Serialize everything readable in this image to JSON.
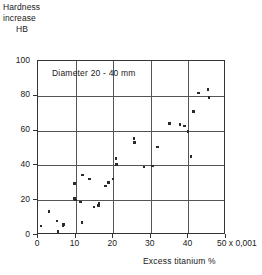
{
  "figure": {
    "y_axis_caption_lines": [
      "Hardness",
      "increase",
      "HB"
    ],
    "x_axis_title": "Excess titanium  %",
    "x_multiplier_label": "x 0,001",
    "annotation": "Diameter  20 - 40 mm"
  },
  "chart_data": {
    "type": "scatter",
    "title": "",
    "subtitle": "",
    "annotations": [
      "Diameter  20 - 40 mm"
    ],
    "xlabel": "Excess titanium  %",
    "ylabel": "Hardness increase HB",
    "x_unit_note": "x 0,001",
    "xlim": [
      0,
      50
    ],
    "ylim": [
      0,
      100
    ],
    "xticks": [
      0,
      10,
      20,
      30,
      40,
      50
    ],
    "yticks": [
      0,
      20,
      40,
      60,
      80,
      100
    ],
    "xtick_labels": [
      "0",
      "10",
      "20",
      "30",
      "40",
      "50"
    ],
    "ytick_labels": [
      "0",
      "20",
      "40",
      "60",
      "80",
      "100"
    ],
    "grid": true,
    "legend": null,
    "marker": "square",
    "marker_color": "#2a2a2a",
    "series": [
      {
        "name": "Diameter 20 - 40 mm",
        "points": [
          {
            "x": 1.1,
            "y": 4.5
          },
          {
            "x": 3.2,
            "y": 13.0
          },
          {
            "x": 5.3,
            "y": 7.5
          },
          {
            "x": 5.6,
            "y": 1.5
          },
          {
            "x": 6.9,
            "y": 4.5
          },
          {
            "x": 7.1,
            "y": 5.5
          },
          {
            "x": 9.9,
            "y": 29.0
          },
          {
            "x": 10.0,
            "y": 20.5
          },
          {
            "x": 10.2,
            "y": 19.5
          },
          {
            "x": 11.6,
            "y": 18.5
          },
          {
            "x": 12.0,
            "y": 6.5
          },
          {
            "x": 12.1,
            "y": 34.0
          },
          {
            "x": 14.0,
            "y": 31.5
          },
          {
            "x": 15.2,
            "y": 15.5
          },
          {
            "x": 16.3,
            "y": 16.5
          },
          {
            "x": 16.5,
            "y": 17.5
          },
          {
            "x": 18.2,
            "y": 27.5
          },
          {
            "x": 19.0,
            "y": 29.5
          },
          {
            "x": 20.2,
            "y": 31.5
          },
          {
            "x": 21.0,
            "y": 43.5
          },
          {
            "x": 21.1,
            "y": 40.0
          },
          {
            "x": 25.8,
            "y": 55.0
          },
          {
            "x": 26.0,
            "y": 52.5
          },
          {
            "x": 28.5,
            "y": 38.5
          },
          {
            "x": 30.7,
            "y": 39.0
          },
          {
            "x": 32.0,
            "y": 50.0
          },
          {
            "x": 35.3,
            "y": 63.5
          },
          {
            "x": 38.0,
            "y": 63.0
          },
          {
            "x": 39.2,
            "y": 62.0
          },
          {
            "x": 40.2,
            "y": 59.0
          },
          {
            "x": 41.0,
            "y": 44.5
          },
          {
            "x": 41.7,
            "y": 70.5
          },
          {
            "x": 43.0,
            "y": 81.0
          },
          {
            "x": 45.5,
            "y": 83.0
          },
          {
            "x": 45.7,
            "y": 78.5
          }
        ]
      }
    ]
  }
}
